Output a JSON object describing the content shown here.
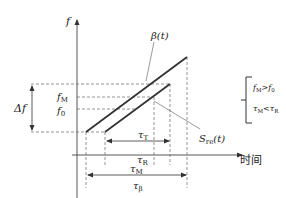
{
  "diagram": {
    "axes": {
      "y_label": "f",
      "x_label": "时间"
    },
    "signals": {
      "beta": "β(t)",
      "s_re": "S",
      "s_re_sub": "re",
      "s_re_arg": "(t)"
    },
    "freq_labels": {
      "f_m": "f",
      "f_m_sub": "M",
      "f_0": "f",
      "f_0_sub": "0",
      "delta_f": "Δf"
    },
    "time_labels": {
      "tau_t": "τ",
      "tau_t_sub": "T",
      "tau_r": "τ",
      "tau_r_sub": "R",
      "tau_m": "τ",
      "tau_m_sub": "M",
      "tau_beta": "τ",
      "tau_beta_sub": "β"
    },
    "conditions": {
      "line1_a": "f",
      "line1_a_sub": "M",
      "line1_op": ">",
      "line1_b": "f",
      "line1_b_sub": "0",
      "line2_a": "τ",
      "line2_a_sub": "M",
      "line2_op": "<",
      "line2_b": "τ",
      "line2_b_sub": "R"
    },
    "colors": {
      "line": "#333333",
      "dash": "#666666"
    }
  }
}
